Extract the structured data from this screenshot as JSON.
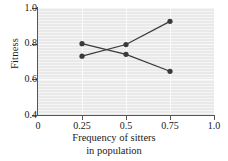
{
  "chart_data": {
    "type": "line",
    "title": "",
    "xlabel": "Frequency of sitters in population",
    "xlabel_line1": "Frequency of sitters",
    "xlabel_line2": "in population",
    "ylabel": "Fitness",
    "xlim": [
      0,
      1.0
    ],
    "ylim": [
      0.4,
      1.0
    ],
    "grid": true,
    "legend": "none",
    "marker": "filled-circle",
    "line_color": "#3a3a3a",
    "marker_color": "#3a3a3a",
    "plot_background": "#e9e9e9",
    "gridline_color": "#fbfbfb",
    "x_ticks": [
      "0",
      "0.25",
      "0.5",
      "0.75",
      "1.0"
    ],
    "x_tick_values": [
      0,
      0.25,
      0.5,
      0.75,
      1.0
    ],
    "y_ticks": [
      "1.0",
      "0.8",
      "0.6",
      "0.4"
    ],
    "y_tick_values": [
      1.0,
      0.8,
      0.6,
      0.4
    ],
    "x": [
      0.25,
      0.5,
      0.75
    ],
    "series": [
      {
        "name": "rising",
        "x": [
          0.25,
          0.5,
          0.75
        ],
        "values": [
          0.73,
          0.795,
          0.925
        ]
      },
      {
        "name": "falling",
        "x": [
          0.25,
          0.5,
          0.75
        ],
        "values": [
          0.8,
          0.74,
          0.645
        ]
      }
    ]
  }
}
